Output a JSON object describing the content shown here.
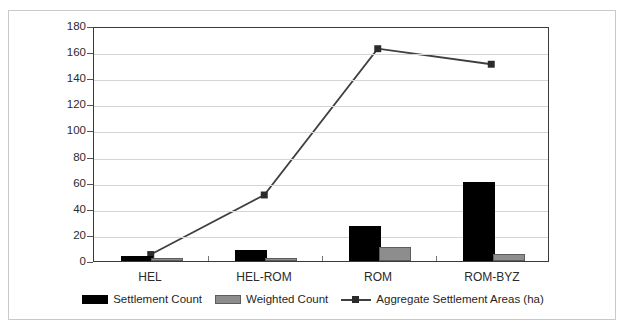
{
  "chart_data": {
    "type": "bar",
    "title": "",
    "xlabel": "",
    "ylabel": "",
    "ylim": [
      0,
      180
    ],
    "ytick_step": 20,
    "grid": true,
    "legend_position": "bottom",
    "categories": [
      "HEL",
      "HEL-ROM",
      "ROM",
      "ROM-BYZ"
    ],
    "ytick_labels": [
      "180",
      "160",
      "140",
      "120",
      "100",
      "80",
      "60",
      "40",
      "20",
      "0"
    ],
    "ytick_values": [
      180,
      160,
      140,
      120,
      100,
      80,
      60,
      40,
      20,
      0
    ],
    "series": [
      {
        "name": "Settlement Count",
        "kind": "bar",
        "color": "#000000",
        "values": [
          2,
          7,
          25,
          59
        ]
      },
      {
        "name": "Weighted Count",
        "kind": "bar",
        "color": "#8d8d8d",
        "values": [
          1,
          1,
          9,
          4
        ]
      },
      {
        "name": "Aggregate Settlement Areas (ha)",
        "kind": "line",
        "color": "#3f3f3f",
        "values": [
          5,
          51,
          164,
          152
        ]
      }
    ]
  },
  "legend": {
    "items": [
      {
        "label": "Settlement Count",
        "marker": "black-bar-swatch"
      },
      {
        "label": "Weighted Count",
        "marker": "gray-bar-swatch"
      },
      {
        "label": "Aggregate Settlement Areas (ha)",
        "marker": "line-square-marker-swatch"
      }
    ]
  }
}
